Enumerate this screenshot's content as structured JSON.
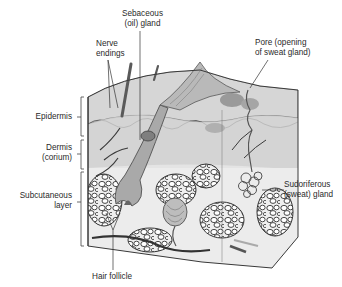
{
  "figure": {
    "type": "anatomical cross-section"
  },
  "labels": {
    "sebaceous_gland": {
      "line1": "Sebaceous",
      "line2": "(oil) gland"
    },
    "nerve_endings": {
      "line1": "Nerve",
      "line2": "endings"
    },
    "pore": {
      "line1": "Pore (opening",
      "line2": "of sweat gland)"
    },
    "epidermis": {
      "line1": "Epidermis"
    },
    "dermis": {
      "line1": "Dermis",
      "line2": "(corium)"
    },
    "subcutaneous": {
      "line1": "Subcutaneous",
      "line2": "layer"
    },
    "sudoriferous_gland": {
      "line1": "Sudoriferous",
      "line2": "(sweat) gland"
    },
    "hair_follicle": {
      "line1": "Hair follicle"
    }
  },
  "colors": {
    "outline": "#3a3a3a",
    "epidermis_fill": "#d9d9d9",
    "dermis_fill": "#c4c4c4",
    "subcutaneous_fill": "#e6e6e6",
    "dark_tissue": "#8a8a8a",
    "text": "#2a2a2a"
  }
}
